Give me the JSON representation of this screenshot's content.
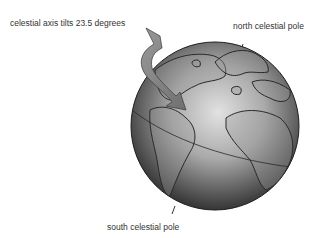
{
  "diagram": {
    "labels": {
      "tilt": "celestial axis tilts 23.5 degrees",
      "north_pole": "north celestial pole",
      "south_pole": "south celestial pole"
    },
    "elements": [
      "globe",
      "curved rotation arrow",
      "equator line",
      "north pole pointer",
      "south pole pointer",
      "continent outlines"
    ],
    "colors": {
      "background": "#ffffff",
      "globe_light": "#d8d8d8",
      "globe_dark": "#2a2a2a",
      "arrow": "#8a8a8a",
      "text": "#333333"
    }
  }
}
